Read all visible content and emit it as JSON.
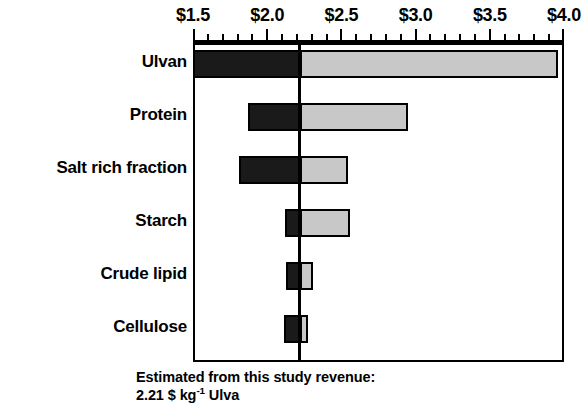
{
  "chart_data": {
    "type": "bar",
    "subtype": "tornado",
    "title": "",
    "xlabel": "",
    "ylabel": "",
    "xlim": [
      1.5,
      4.0
    ],
    "grid": false,
    "legend": null,
    "axis_tick_labels": [
      "$1.5",
      "$2.0",
      "$2.5",
      "$3.0",
      "$3.5",
      "$4.0"
    ],
    "axis_tick_values": [
      1.5,
      2.0,
      2.5,
      3.0,
      3.5,
      4.0
    ],
    "minor_tick_step": 0.1,
    "baseline_value": 2.21,
    "value_unit": "$ kg-1 Ulva",
    "categories": [
      "Ulvan",
      "Protein",
      "Salt rich fraction",
      "Starch",
      "Crude lipid",
      "Cellulose"
    ],
    "bars": [
      {
        "category": "Ulvan",
        "low": 1.5,
        "high": 3.93
      },
      {
        "category": "Protein",
        "low": 1.87,
        "high": 2.92
      },
      {
        "category": "Salt rich fraction",
        "low": 1.81,
        "high": 2.52
      },
      {
        "category": "Starch",
        "low": 2.12,
        "high": 2.53
      },
      {
        "category": "Crude lipid",
        "low": 2.13,
        "high": 2.28
      },
      {
        "category": "Cellulose",
        "low": 2.11,
        "high": 2.25
      }
    ],
    "colors": {
      "low_segment": "#1a1a1a",
      "high_segment": "#c8c8c8",
      "outline": "#000000",
      "baseline": "#000000",
      "background": "#ffffff"
    }
  },
  "caption": {
    "line1": "Estimated from this study revenue:",
    "line2_value": "2.21 $ kg",
    "line2_sup": "-1",
    "line2_tail": " Ulva"
  }
}
